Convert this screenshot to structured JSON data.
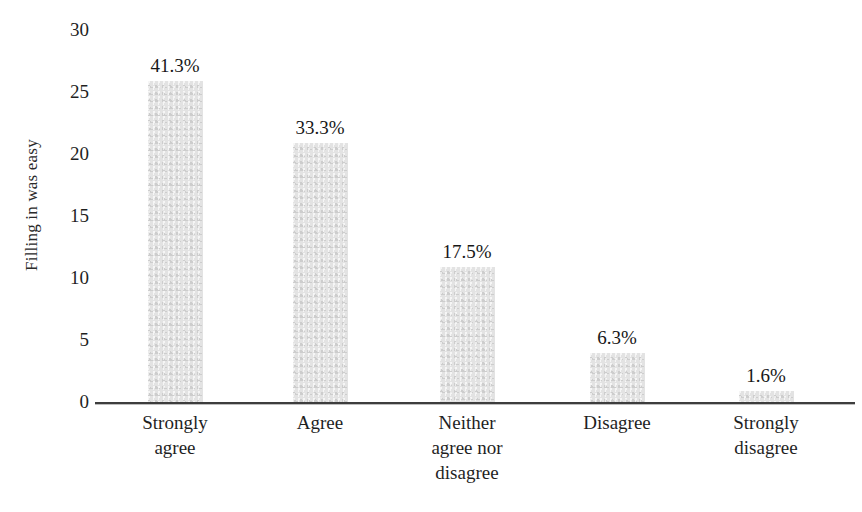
{
  "chart_data": {
    "type": "bar",
    "title": "",
    "xlabel": "",
    "ylabel": "Filling in was easy",
    "ylim": [
      0,
      30
    ],
    "yticks": [
      "0",
      "5",
      "10",
      "15",
      "20",
      "25",
      "30"
    ],
    "grid": false,
    "legend": null,
    "categories": [
      "Strongly agree",
      "Agree",
      "Neither agree nor disagree",
      "Disagree",
      "Strongly disagree"
    ],
    "category_lines": [
      [
        "Strongly",
        "agree"
      ],
      [
        "Agree"
      ],
      [
        "Neither",
        "agree nor",
        "disagree"
      ],
      [
        "Disagree"
      ],
      [
        "Strongly",
        "disagree"
      ]
    ],
    "values": [
      26,
      21,
      11,
      4,
      1
    ],
    "data_labels": [
      "41.3%",
      "33.3%",
      "17.5%",
      "6.3%",
      "1.6%"
    ],
    "percentages": [
      41.3,
      33.3,
      17.5,
      6.3,
      1.6
    ],
    "bar_color": "#dcdcdc",
    "axis_color": "#3d3d3d",
    "text_color": "#1f1f1f"
  }
}
